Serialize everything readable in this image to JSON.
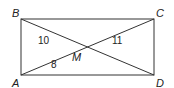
{
  "diagram": {
    "type": "rectangle-with-diagonals",
    "vertices": [
      {
        "name": "A",
        "label": "A"
      },
      {
        "name": "B",
        "label": "B"
      },
      {
        "name": "C",
        "label": "C"
      },
      {
        "name": "D",
        "label": "D"
      }
    ],
    "intersection": {
      "name": "M",
      "label": "M"
    },
    "segment_labels": [
      {
        "segment": "BM",
        "value": "10"
      },
      {
        "segment": "MC",
        "value": "11"
      },
      {
        "segment": "AM",
        "value": "8"
      }
    ]
  }
}
